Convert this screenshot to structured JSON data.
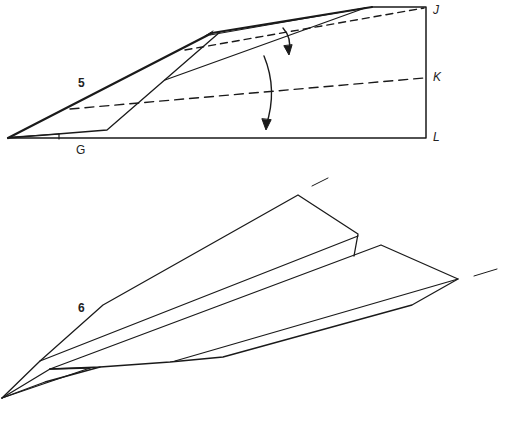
{
  "diagram": {
    "steps": [
      {
        "number": "5",
        "points": {
          "J": "J",
          "K": "K",
          "L": "L",
          "G": "G"
        },
        "fold_lines": [
          "dashed fold line to J",
          "dashed fold line to K"
        ],
        "arrows": [
          "fold-down arrow (short)",
          "fold-down arrow (long)"
        ]
      },
      {
        "number": "6",
        "description": "Finished paper airplane with wings folded out"
      }
    ],
    "colors": {
      "ink": "#1a1a1a",
      "background": "#ffffff"
    }
  }
}
